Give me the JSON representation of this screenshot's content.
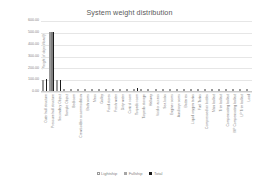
{
  "chart_data": {
    "type": "bar",
    "title": "System weight distribution",
    "xlabel": "",
    "ylabel": "Weight of object/load [t]",
    "ylim": [
      0,
      600
    ],
    "ytick_labels": [
      "600.00",
      "500.00",
      "400.00",
      "300.00",
      "200.00",
      "100.00",
      "0.00"
    ],
    "ytick_values": [
      600,
      500,
      400,
      300,
      200,
      100,
      0
    ],
    "grid": true,
    "legend_position": "bottom",
    "categories": [
      "Outer hull structure",
      "Pressure hull structure",
      "Secondary Object",
      "Sample Object",
      "Bedroom",
      "Crew/soldier accommodation",
      "Bathrooms",
      "Mess",
      "Galley",
      "Food stores",
      "Fresh water",
      "Dirty water",
      "Control room",
      "Torpedo room",
      "Torpedo storage",
      "Hallway",
      "Void or access",
      "Sea locks",
      "Engine rooms",
      "Auxiliary rooms",
      "Batteries",
      "Liquid oxygen tanks",
      "Fuel Tanks",
      "Compressed air bottles",
      "Main ballast",
      "Trim ballast",
      "Compensating ballast",
      "MP Compensating ballast",
      "LP Trim ballast",
      "Load"
    ],
    "series": [
      {
        "name": "Lightship",
        "values": [
          95,
          500,
          92,
          0,
          0,
          0,
          0,
          0,
          0,
          0,
          0,
          0,
          0,
          0,
          0,
          0,
          0,
          0,
          0,
          0,
          0,
          0,
          0,
          0,
          0,
          0,
          0,
          0,
          0,
          0
        ]
      },
      {
        "name": "Fullship",
        "values": [
          0,
          500,
          0,
          0,
          0,
          0,
          0,
          0,
          0,
          0,
          0,
          0,
          0,
          0,
          0,
          0,
          0,
          0,
          0,
          0,
          0,
          0,
          0,
          0,
          0,
          0,
          0,
          0,
          0,
          0
        ]
      },
      {
        "name": "Total",
        "values": [
          100,
          500,
          95,
          0,
          0,
          0,
          0,
          0,
          0,
          0,
          0,
          0,
          0,
          25,
          0,
          0,
          0,
          0,
          0,
          0,
          0,
          0,
          0,
          0,
          0,
          0,
          0,
          0,
          0,
          0
        ]
      }
    ]
  },
  "colors": {
    "lightship": "#d9d9d9",
    "fullship": "#7f7f7f",
    "total": "#1a1a1a",
    "gridline": "#e6e6e6",
    "text": "#7f7f7f",
    "title": "#595959"
  }
}
